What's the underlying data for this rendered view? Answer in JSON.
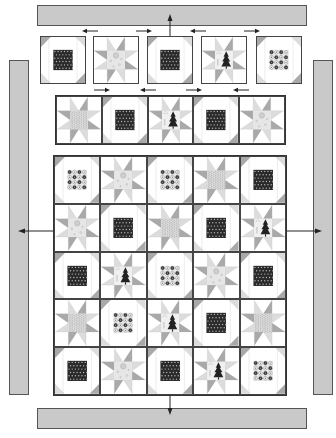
{
  "diagram": {
    "type": "quilt assembly diagram",
    "colors": {
      "border_fill": "#c9c9c9",
      "outline": "#444444",
      "triangle_gray": "#a9a9a9",
      "light_gray": "#dcdcdc",
      "dark_center": "#2a2a2a",
      "background": "#ffffff"
    },
    "borders": {
      "top": {
        "label": "top border strip"
      },
      "bottom": {
        "label": "bottom border strip"
      },
      "left": {
        "label": "left border strip"
      },
      "right": {
        "label": "right border strip"
      }
    },
    "top_row": {
      "blocks": [
        "snowball-dots",
        "star-print",
        "snowball-dots",
        "star-tree",
        "snowball-circles"
      ],
      "pressing_arrows": [
        "left",
        "right",
        "left",
        "right"
      ]
    },
    "middle_row": {
      "blocks": [
        "star-speckle",
        "snowball-dots",
        "star-tree",
        "snowball-dots",
        "star-print"
      ],
      "pressing_arrows": [
        "right",
        "left",
        "right",
        "left"
      ]
    },
    "main_grid": {
      "rows": 5,
      "cols": 5,
      "blocks": [
        [
          "snowball-circles",
          "star-print",
          "snowball-circles",
          "star-speckle",
          "snowball-dots"
        ],
        [
          "star-print",
          "snowball-dots",
          "star-speckle",
          "snowball-dots",
          "star-tree"
        ],
        [
          "snowball-dots",
          "star-tree",
          "snowball-circles",
          "star-print",
          "snowball-dots"
        ],
        [
          "star-speckle",
          "snowball-circles",
          "star-tree",
          "snowball-dots",
          "star-speckle"
        ],
        [
          "snowball-dots",
          "star-print",
          "snowball-dots",
          "star-tree",
          "snowball-circles"
        ]
      ]
    },
    "assembly_arrows": [
      "top border attaches down",
      "bottom border attaches up",
      "left border attaches",
      "right border attaches"
    ]
  }
}
